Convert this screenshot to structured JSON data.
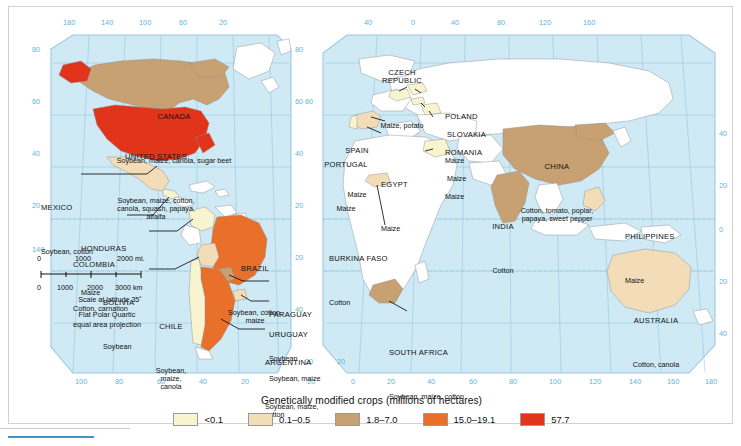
{
  "map": {
    "title_caption": "Genetically modified crops (millions of hectares)",
    "projection_line1": "Flat Polar Quartic",
    "projection_line2": "equal area projection",
    "scale": {
      "miles_ticks": [
        "0",
        "1000",
        "2000 mi."
      ],
      "km_ticks": [
        "0",
        "1000",
        "2000",
        "3000 km"
      ],
      "caption": "Scale at latitude 35˚"
    },
    "graticule": {
      "top_labels_west": [
        "180",
        "140",
        "100",
        "60",
        "20"
      ],
      "top_labels_east": [
        "40",
        "0",
        "40",
        "80",
        "120",
        "160"
      ],
      "bottom_labels_west": [
        "100",
        "80",
        "60",
        "40",
        "20"
      ],
      "bottom_labels_east": [
        "20",
        "0",
        "20",
        "40",
        "60",
        "80",
        "100",
        "120",
        "140",
        "160",
        "180"
      ],
      "left_labels": [
        "80",
        "60",
        "40",
        "20"
      ],
      "left_bottom_label": "140",
      "right_labels": [
        "40",
        "20",
        "0",
        "20",
        "40"
      ],
      "center_left_labels": [
        "60",
        "20"
      ],
      "center_right_labels": [
        "20"
      ],
      "inner_labels": [
        "80",
        "60",
        "40",
        "20",
        "20",
        "40"
      ]
    },
    "legend": {
      "title": "Genetically modified crops (millions of hectares)",
      "items": [
        {
          "label": "<0.1",
          "color": "#f7f4cf"
        },
        {
          "label": "0.1–0.5",
          "color": "#f3ddb9"
        },
        {
          "label": "1.8–7.0",
          "color": "#c8a173"
        },
        {
          "label": "15.0–19.1",
          "color": "#e8702a"
        },
        {
          "label": "57.7",
          "color": "#e1341a"
        }
      ]
    },
    "countries": [
      {
        "name": "CANADA",
        "crops": "Soybean, maize, canola, sugar beet",
        "class": "c3"
      },
      {
        "name": "UNITED STATES",
        "crops": "Soybean, maize, cotton,\ncanola, squash, papaya,\nalfalfa",
        "class": "c5"
      },
      {
        "name": "MEXICO",
        "crops": "Soybean, cotton",
        "class": "c2"
      },
      {
        "name": "HONDURAS",
        "crops": "Maize",
        "class": "c1"
      },
      {
        "name": "COLOMBIA",
        "crops": "Cotton, carnation",
        "class": "c1"
      },
      {
        "name": "BRAZIL",
        "crops": "Soybean, cotton,\nmaize",
        "class": "c4"
      },
      {
        "name": "BOLIVIA",
        "crops": "Soybean",
        "class": "c2"
      },
      {
        "name": "PARAGUAY",
        "crops": "Soybean",
        "class": "c3"
      },
      {
        "name": "CHILE",
        "crops": "Soybean,\nmaize,\ncanola",
        "class": "c1"
      },
      {
        "name": "URUGUAY",
        "crops": "Soybean, maize",
        "class": "c2"
      },
      {
        "name": "ARGENTINA",
        "crops": "Soybean, maize,\ncotton",
        "class": "c4"
      },
      {
        "name": "SPAIN",
        "crops": "Maize",
        "class": "c2"
      },
      {
        "name": "PORTUGAL",
        "crops": "Maize",
        "class": "c1"
      },
      {
        "name": "CZECH\nREPUBLIC",
        "crops": "Maize, potato",
        "class": "c1"
      },
      {
        "name": "POLAND",
        "crops": "Maize",
        "class": "c1"
      },
      {
        "name": "SLOVAKIA",
        "crops": "Maize",
        "class": "c1"
      },
      {
        "name": "ROMANIA",
        "crops": "Maize",
        "class": "c1"
      },
      {
        "name": "EGYPT",
        "crops": "Maize",
        "class": "c1"
      },
      {
        "name": "BURKINA FASO",
        "crops": "Cotton",
        "class": "c2"
      },
      {
        "name": "SOUTH AFRICA",
        "crops": "Soybean, maize, cotton",
        "class": "c3"
      },
      {
        "name": "CHINA",
        "crops": "Cotton, tomato, poplar,\npapaya, sweet pepper",
        "class": "c3"
      },
      {
        "name": "INDIA",
        "crops": "Cotton",
        "class": "c3"
      },
      {
        "name": "PHILIPPINES",
        "crops": "Maize",
        "class": "c2"
      },
      {
        "name": "AUSTRALIA",
        "crops": "Cotton, canola",
        "class": "c2"
      }
    ]
  }
}
